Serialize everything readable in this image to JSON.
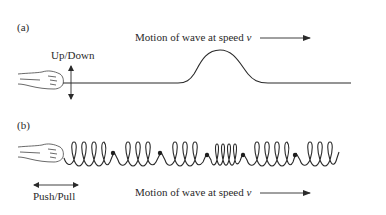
{
  "panel_a": {
    "label": "(a)",
    "action_label": "Up/Down",
    "motion_text": "Motion of wave at speed",
    "speed_symbol": "v",
    "wave_type": "transverse pulse on rope"
  },
  "panel_b": {
    "label": "(b)",
    "action_label": "Push/Pull",
    "motion_text": "Motion of wave at speed",
    "speed_symbol": "v",
    "wave_type": "longitudinal compression on spring"
  },
  "colors": {
    "line": "#2a2a2a",
    "background": "#ffffff"
  }
}
